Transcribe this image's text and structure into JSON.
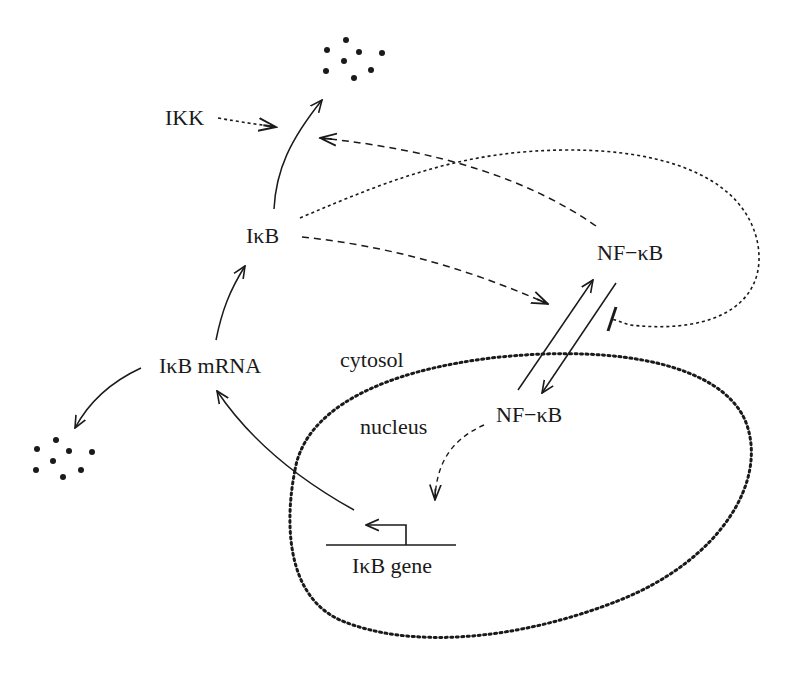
{
  "diagram": {
    "nodes": {
      "ikk": "IKK",
      "ikb": "IκB",
      "ikb_mrna": "IκB mRNA",
      "nfkb_cytosol": "NF−κB",
      "nfkb_nucleus": "NF−κB",
      "ikb_gene": "IκB gene"
    },
    "compartments": {
      "cytosol": "cytosol",
      "nucleus": "nucleus"
    },
    "edges": [
      {
        "from": "IκB",
        "to": "degradation (top)",
        "style": "solid"
      },
      {
        "from": "IKK",
        "to": "IκB degradation",
        "style": "dotted",
        "type": "activation"
      },
      {
        "from": "NF−κB (cytosol)",
        "to": "IκB degradation",
        "style": "dashed",
        "type": "activation"
      },
      {
        "from": "IκB",
        "to": "NF−κB import",
        "style": "dotted",
        "type": "inhibition"
      },
      {
        "from": "IκB",
        "to": "NF−κB export",
        "style": "dashed",
        "type": "activation"
      },
      {
        "from": "NF−κB (cytosol)",
        "to": "NF−κB (nucleus)",
        "style": "solid"
      },
      {
        "from": "NF−κB (nucleus)",
        "to": "NF−κB (cytosol)",
        "style": "solid"
      },
      {
        "from": "NF−κB (nucleus)",
        "to": "IκB gene",
        "style": "dashed",
        "type": "activation"
      },
      {
        "from": "IκB gene",
        "to": "IκB mRNA",
        "style": "solid"
      },
      {
        "from": "IκB mRNA",
        "to": "IκB",
        "style": "solid"
      },
      {
        "from": "IκB mRNA",
        "to": "degradation (bottom-left)",
        "style": "solid"
      }
    ],
    "colors": {
      "ink": "#1a1a1a",
      "background": "#ffffff"
    }
  }
}
